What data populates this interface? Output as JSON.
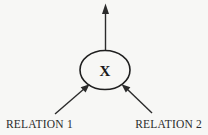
{
  "diagram": {
    "type": "entity-relationship",
    "background_color": "#f7f7f5",
    "stroke_color": "#2b2b2b",
    "node": {
      "shape": "ellipse",
      "label": "X",
      "center_x": 105,
      "center_y": 70,
      "radius_x": 25,
      "radius_y": 19
    },
    "edges": [
      {
        "name": "output-arrow",
        "label": "",
        "direction": "up",
        "from_x": 105,
        "from_y": 51,
        "to_x": 105,
        "to_y": 5
      },
      {
        "name": "relation-1-arrow",
        "label": "RELATION 1",
        "direction": "up-right",
        "from_x": 55,
        "from_y": 114,
        "to_x": 88,
        "to_y": 85
      },
      {
        "name": "relation-2-arrow",
        "label": "RELATION 2",
        "direction": "up-left",
        "from_x": 152,
        "from_y": 113,
        "to_x": 123,
        "to_y": 85
      }
    ],
    "labels": {
      "relation_1": "RELATION 1",
      "relation_2": "RELATION 2",
      "relation_1_x": 6,
      "relation_1_y": 128,
      "relation_2_x": 127,
      "relation_2_y": 128
    }
  }
}
